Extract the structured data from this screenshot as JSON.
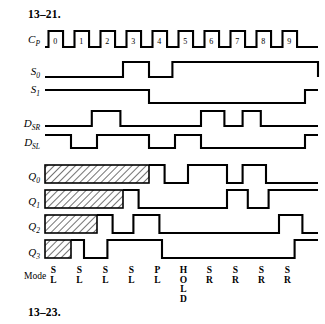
{
  "figure": {
    "problem_number_top": "13–21.",
    "problem_number_bottom": "13–23.",
    "mode_row_label": "Mode",
    "type": "timing-diagram",
    "geometry": {
      "x_start": 45,
      "x_end": 318,
      "cycles": 10,
      "cycle_width": 26.0
    }
  },
  "signals": [
    {
      "key": "cp",
      "name": "C",
      "subscript": "P",
      "label_y": 43,
      "baseline_y": 47,
      "high_y": 31,
      "type": "clock"
    },
    {
      "key": "s0",
      "name": "S",
      "subscript": "0",
      "label_y": 75,
      "baseline_y": 77,
      "high_y": 62,
      "type": "level",
      "transitions": [
        3.0,
        4.0,
        4.9,
        10.5
      ]
    },
    {
      "key": "s1",
      "name": "S",
      "subscript": "1",
      "label_y": 93,
      "baseline_y": 90,
      "high_y": 103,
      "type": "level-inverted",
      "transitions": [
        4.0,
        10.0
      ]
    },
    {
      "key": "dsr",
      "name": "D",
      "subscript": "SR",
      "label_y": 127,
      "baseline_y": 126,
      "high_y": 111,
      "type": "level",
      "transitions": [
        1.8,
        2.9,
        6.0,
        6.9,
        7.6,
        8.3
      ]
    },
    {
      "key": "dsl",
      "name": "D",
      "subscript": "SL",
      "label_y": 146,
      "baseline_y": 135,
      "high_y": 148,
      "type": "level-inverted",
      "transitions": [
        1.0,
        2.0,
        4.0,
        5.0,
        6.0,
        10.0
      ]
    },
    {
      "key": "q0",
      "name": "Q",
      "subscript": "0",
      "label_y": 180,
      "baseline_y": 183,
      "high_y": 165,
      "type": "output",
      "dontcare_until": 4.0,
      "transitions": [
        4.6,
        5.5,
        7.0,
        7.6,
        8.5
      ]
    },
    {
      "key": "q1",
      "name": "Q",
      "subscript": "1",
      "label_y": 205,
      "baseline_y": 208,
      "high_y": 190,
      "type": "output",
      "dontcare_until": 3.0,
      "transitions": [
        3.6,
        7.0,
        7.8,
        8.6
      ]
    },
    {
      "key": "q2",
      "name": "Q",
      "subscript": "2",
      "label_y": 230,
      "baseline_y": 233,
      "high_y": 215,
      "type": "output",
      "dontcare_until": 2.0,
      "transitions": [
        2.6,
        3.4,
        4.4,
        9.0,
        9.9
      ]
    },
    {
      "key": "q3",
      "name": "Q",
      "subscript": "3",
      "label_y": 256,
      "baseline_y": 258,
      "high_y": 240,
      "type": "output",
      "dontcare_until": 1.0,
      "transitions": [
        1.5,
        2.4,
        4.5,
        9.6
      ]
    }
  ],
  "clock_cycle_labels": [
    "0",
    "1",
    "2",
    "3",
    "4",
    "5",
    "6",
    "7",
    "8",
    "9"
  ],
  "modes": [
    {
      "cycle": 0,
      "lines": [
        "S",
        "L"
      ]
    },
    {
      "cycle": 1,
      "lines": [
        "S",
        "L"
      ]
    },
    {
      "cycle": 2,
      "lines": [
        "S",
        "L"
      ]
    },
    {
      "cycle": 3,
      "lines": [
        "S",
        "L"
      ]
    },
    {
      "cycle": 4,
      "lines": [
        "P",
        "L"
      ]
    },
    {
      "cycle": 5,
      "lines": [
        "H",
        "O",
        "L",
        "D"
      ]
    },
    {
      "cycle": 6,
      "lines": [
        "S",
        "R"
      ]
    },
    {
      "cycle": 7,
      "lines": [
        "S",
        "R"
      ]
    },
    {
      "cycle": 8,
      "lines": [
        "S",
        "R"
      ]
    },
    {
      "cycle": 9,
      "lines": [
        "S",
        "R"
      ]
    }
  ],
  "colors": {
    "ink": "#000000",
    "background": "#ffffff"
  }
}
